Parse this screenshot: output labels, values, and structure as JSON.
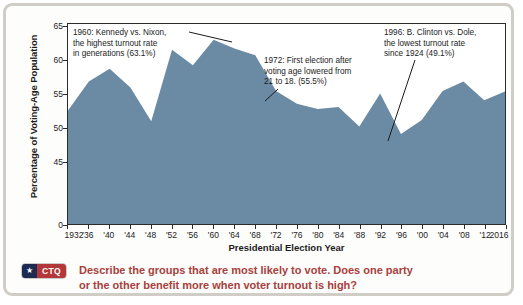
{
  "figure": {
    "border_color": "#cfcdc6",
    "background": "#fdfdfb"
  },
  "chart_data": {
    "type": "area",
    "title": "",
    "xlabel": "Presidential Election Year",
    "ylabel": "Percentage of Voting-Age Population",
    "xlim": [
      1932,
      2016
    ],
    "ylim": [
      0,
      65
    ],
    "y_axis_broken": true,
    "y_break_note": "axis shows 0 then jumps to 45",
    "grid": false,
    "legend": null,
    "fill_color": "#6b8ba4",
    "categories": [
      1932,
      1936,
      1940,
      1944,
      1948,
      1952,
      1956,
      1960,
      1964,
      1968,
      1972,
      1976,
      1980,
      1984,
      1988,
      1992,
      1996,
      2000,
      2004,
      2008,
      2012,
      2016
    ],
    "x_tick_labels": [
      "1932",
      "'36",
      "'40",
      "'44",
      "'48",
      "'52",
      "'56",
      "'60",
      "'64",
      "'68",
      "'72",
      "'76",
      "'80",
      "'84",
      "'88",
      "'92",
      "'96",
      "'00",
      "'04",
      "'08",
      "'12",
      "2016"
    ],
    "y_tick_labels": [
      "65",
      "60",
      "55",
      "50",
      "45",
      "0"
    ],
    "y_tick_values": [
      65,
      60,
      55,
      50,
      45,
      0
    ],
    "values": [
      52.6,
      56.9,
      58.8,
      56.0,
      51.0,
      61.6,
      59.3,
      63.1,
      61.8,
      60.8,
      55.5,
      53.6,
      52.8,
      53.1,
      50.2,
      55.1,
      49.1,
      51.2,
      55.5,
      56.9,
      54.1,
      55.4
    ],
    "series": [
      {
        "name": "Voter turnout",
        "values": [
          52.6,
          56.9,
          58.8,
          56.0,
          51.0,
          61.6,
          59.3,
          63.1,
          61.8,
          60.8,
          55.5,
          53.6,
          52.8,
          53.1,
          50.2,
          55.1,
          49.1,
          51.2,
          55.5,
          56.9,
          54.1,
          55.4
        ]
      }
    ],
    "annotations": [
      {
        "id": "1960",
        "text": "1960: Kennedy vs. Nixon,\nthe highest turnout rate\nin generations (63.1%)",
        "points_to_year": 1960,
        "points_to_value": 63.1
      },
      {
        "id": "1972",
        "text": "1972: First election after\nvoting age lowered from\n21 to 18. (55.5%)",
        "points_to_year": 1972,
        "points_to_value": 55.5
      },
      {
        "id": "1996",
        "text": "1996: B. Clinton vs. Dole,\nthe lowest turnout rate\nsince 1924 (49.1%)",
        "points_to_year": 1996,
        "points_to_value": 49.1
      }
    ]
  },
  "caption": {
    "badge_label": "CTQ",
    "badge_star_icon": "★",
    "badge_navy_color": "#1d2a52",
    "badge_red_color": "#b4373a",
    "text": "Describe the groups that are most likely to vote. Does one party\nor the other benefit more when voter turnout is high?",
    "text_color": "#a8403c"
  }
}
